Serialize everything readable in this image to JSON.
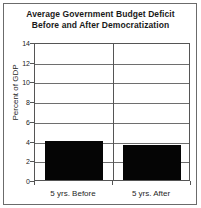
{
  "chart_data": {
    "type": "bar",
    "title": "Average Government Budget Deficit Before and After Democratization",
    "title_lines": [
      "Average Government Budget Deficit",
      "Before and After Democratization"
    ],
    "categories": [
      "5 yrs. Before",
      "5 yrs. After"
    ],
    "values": [
      4.0,
      3.5
    ],
    "xlabel": "",
    "ylabel": "Percent of GDP",
    "ylim": [
      0,
      14
    ],
    "ytick_values": [
      0,
      2,
      4,
      6,
      8,
      10,
      12,
      14
    ],
    "ytick_labels": [
      "0",
      "2",
      "4",
      "6",
      "8",
      "10",
      "12",
      "14"
    ],
    "grid": true,
    "grid_axis": "y",
    "legend": false,
    "bar_color": "#050505",
    "frame_color": "#555555",
    "grid_color": "#6e6e6e",
    "background": "#ffffff"
  }
}
